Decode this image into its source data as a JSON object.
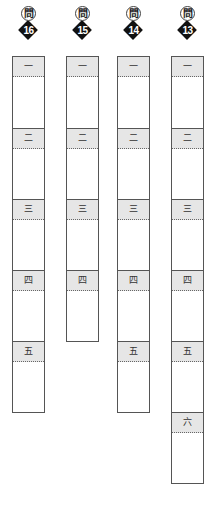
{
  "badge_prefix": "問",
  "questions": [
    {
      "number": "16",
      "sections": [
        "一",
        "二",
        "三",
        "四",
        "五"
      ]
    },
    {
      "number": "15",
      "sections": [
        "一",
        "二",
        "三",
        "四"
      ]
    },
    {
      "number": "14",
      "sections": [
        "一",
        "二",
        "三",
        "四",
        "五"
      ]
    },
    {
      "number": "13",
      "sections": [
        "一",
        "二",
        "三",
        "四",
        "五",
        "六"
      ]
    }
  ],
  "colors": {
    "header_band": "#e6e6e6",
    "border": "#555555",
    "badge": "#111111"
  }
}
